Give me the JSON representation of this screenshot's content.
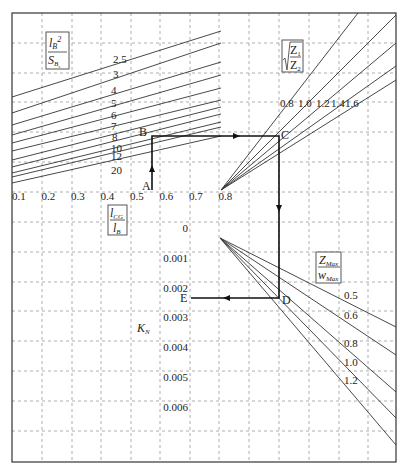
{
  "diagram": {
    "type": "nomogram",
    "frame": {
      "x0": 12,
      "y0": 13,
      "x1": 396,
      "y1": 462
    },
    "grid": {
      "x": [
        42,
        72,
        101,
        131,
        160,
        190,
        219,
        249,
        279,
        309,
        339,
        368
      ],
      "y": [
        43,
        73,
        102,
        132,
        162,
        192,
        222,
        252,
        282,
        311,
        341,
        371,
        401,
        431
      ]
    },
    "top_left_quadrant": {
      "box_label": {
        "numerator": "l_B²",
        "denominator": "S_Bs"
      },
      "curves": [
        {
          "label": "2.5",
          "y_left": 97,
          "y_right": 31,
          "label_x": 113,
          "label_y": 63
        },
        {
          "label": "3",
          "y_left": 113,
          "y_right": 43,
          "label_x": 113,
          "label_y": 78
        },
        {
          "label": "4",
          "y_left": 125,
          "y_right": 62,
          "label_x": 111,
          "label_y": 94
        },
        {
          "label": "5",
          "y_left": 135,
          "y_right": 75,
          "label_x": 111,
          "label_y": 107
        },
        {
          "label": "6",
          "y_left": 143,
          "y_right": 88,
          "label_x": 111,
          "label_y": 119
        },
        {
          "label": "7",
          "y_left": 151,
          "y_right": 100,
          "label_x": 111,
          "label_y": 130
        },
        {
          "label": "8",
          "y_left": 160,
          "y_right": 107,
          "label_x": 112,
          "label_y": 141
        },
        {
          "label": "10",
          "y_left": 167,
          "y_right": 114,
          "label_x": 111,
          "label_y": 152
        },
        {
          "label": "12",
          "y_left": 173,
          "y_right": 122,
          "label_x": 111,
          "label_y": 160
        },
        {
          "label": "15",
          "y_left": 177,
          "y_right": 127,
          "label_x": 111,
          "label_y": 160
        },
        {
          "label": "20",
          "y_left": 183,
          "y_right": 136,
          "label_x": 111,
          "label_y": 174
        }
      ]
    },
    "x_axis": {
      "label": {
        "numerator": "l_CG",
        "denominator": "l_B"
      },
      "ticks": [
        "0.1",
        "0.2",
        "0.3",
        "0.4",
        "0.5",
        "0.6",
        "0.7",
        "0.8"
      ]
    },
    "top_right_quadrant": {
      "box_label": "√(Z1/Z2)",
      "origin": {
        "x": 221,
        "y": 190
      },
      "curves": [
        {
          "label": "0.8",
          "end": {
            "x": 358,
            "y": 13
          }
        },
        {
          "label": "1.0",
          "end": {
            "x": 396,
            "y": 15
          }
        },
        {
          "label": "1.2",
          "end": {
            "x": 396,
            "y": 43
          }
        },
        {
          "label": "1.4",
          "end": {
            "x": 396,
            "y": 66
          }
        },
        {
          "label": "1.6",
          "end": {
            "x": 396,
            "y": 80
          }
        }
      ]
    },
    "bottom_right_quadrant": {
      "box_label": {
        "numerator": "Z_Max",
        "denominator": "w_Max"
      },
      "origin": {
        "x": 220,
        "y": 238
      },
      "curves": [
        {
          "label": "0.5",
          "end": {
            "x": 396,
            "y": 327
          }
        },
        {
          "label": "0.6",
          "end": {
            "x": 396,
            "y": 355
          }
        },
        {
          "label": "0.8",
          "end": {
            "x": 396,
            "y": 392
          }
        },
        {
          "label": "1.0",
          "end": {
            "x": 396,
            "y": 418
          }
        },
        {
          "label": "1.2",
          "end": {
            "x": 396,
            "y": 445
          }
        }
      ]
    },
    "k_axis": {
      "label": "K_N",
      "ticks": [
        "0",
        "0.001",
        "0.002",
        "0.003",
        "0.004",
        "0.005",
        "0.006"
      ]
    },
    "solution_path": {
      "points": {
        "A": {
          "x": 152,
          "y": 190
        },
        "B": {
          "x": 152,
          "y": 136
        },
        "C": {
          "x": 279,
          "y": 136
        },
        "D": {
          "x": 279,
          "y": 298
        },
        "E": {
          "x": 191,
          "y": 298
        }
      },
      "labels": {
        "A": "A",
        "B": "B",
        "C": "C",
        "D": "D",
        "E": "E"
      }
    }
  }
}
